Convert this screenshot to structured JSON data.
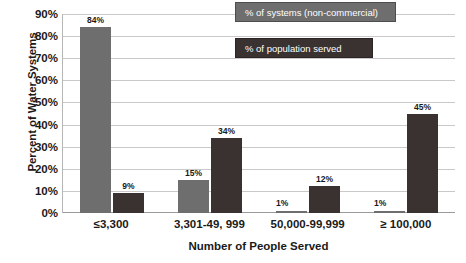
{
  "chart_data": {
    "type": "bar",
    "title": "",
    "xlabel": "Number of People Served",
    "ylabel": "Percent of Water Systems",
    "categories": [
      "≤3,300",
      "3,301-49, 999",
      "50,000-99,999",
      "≥ 100,000"
    ],
    "series": [
      {
        "name": "% of systems (non-commercial)",
        "color": "#6e6e6e",
        "values": [
          84,
          15,
          1,
          1
        ],
        "labels": [
          "84%",
          "15%",
          "1%",
          "1%"
        ]
      },
      {
        "name": "% of population served",
        "color": "#3a3230",
        "values": [
          9,
          34,
          12,
          45
        ],
        "labels": [
          "9%",
          "34%",
          "12%",
          "45%"
        ]
      }
    ],
    "ylim": [
      0,
      90
    ],
    "yticks": [
      90,
      80,
      70,
      60,
      50,
      40,
      30,
      20,
      10,
      0
    ],
    "ytick_labels": [
      "90%",
      "80%",
      "70%",
      "60%",
      "50%",
      "40%",
      "30%",
      "20%",
      "10%",
      "0%"
    ],
    "grid": true,
    "legend_position": "top-right-overlay"
  },
  "legend": {
    "items": [
      {
        "label": "% of systems (non-commercial)",
        "color": "#6e6e6e"
      },
      {
        "label": "% of population served",
        "color": "#3a3230"
      }
    ]
  }
}
